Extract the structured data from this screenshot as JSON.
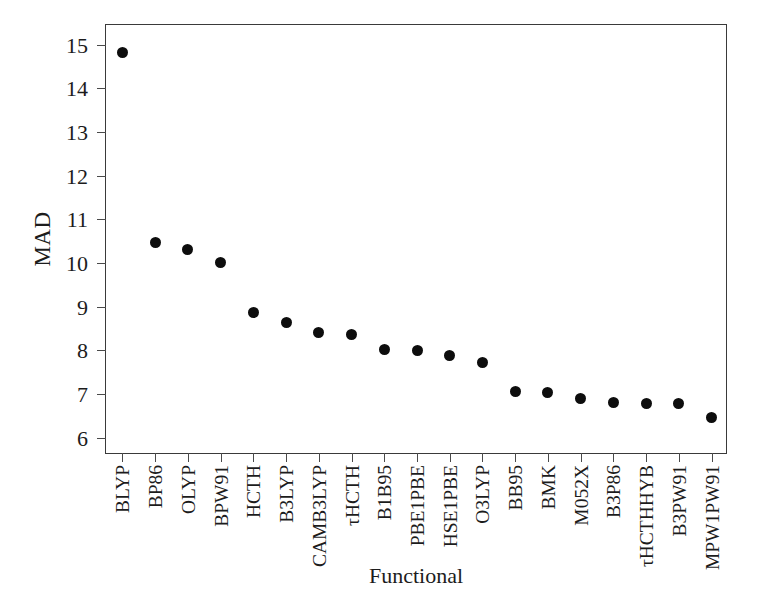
{
  "chart_data": {
    "type": "scatter",
    "title": "",
    "xlabel": "Functional",
    "ylabel": "MAD",
    "categories": [
      "BLYP",
      "BP86",
      "OLYP",
      "BPW91",
      "HCTH",
      "B3LYP",
      "CAMB3LYP",
      "τHCTH",
      "B1B95",
      "PBE1PBE",
      "HSE1PBE",
      "O3LYP",
      "BB95",
      "BMK",
      "M052X",
      "B3P86",
      "τHCTHHYB",
      "B3PW91",
      "MPW1PW91"
    ],
    "values": [
      14.82,
      10.47,
      10.31,
      10.0,
      8.87,
      8.63,
      8.4,
      8.37,
      8.01,
      8.0,
      7.88,
      7.73,
      7.05,
      7.03,
      6.9,
      6.8,
      6.79,
      6.78,
      6.45
    ],
    "ylim": [
      5.6,
      15.45
    ],
    "yticks": [
      15,
      14,
      13,
      12,
      11,
      10,
      9,
      8,
      7,
      6
    ],
    "ytick_labels": [
      "15",
      "14",
      "13",
      "12",
      "11",
      "10",
      "9",
      "8",
      "7",
      "6"
    ],
    "grid": false,
    "legend": false,
    "marker": "filled-circle",
    "marker_color": "#0d0d0d",
    "frame_color": "#3a3a3a"
  }
}
